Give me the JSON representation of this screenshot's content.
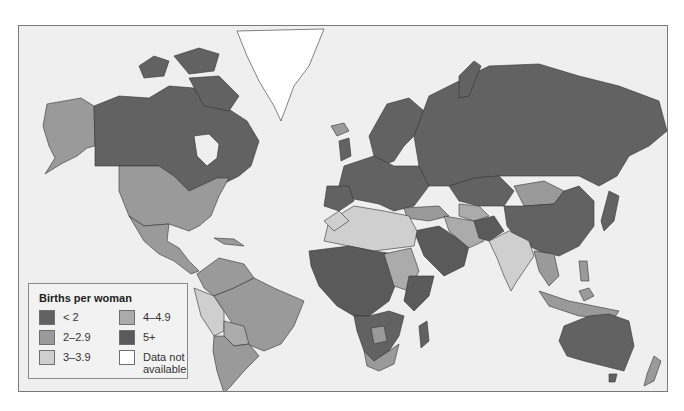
{
  "legend": {
    "title": "Births per woman",
    "items": [
      {
        "label": "< 2",
        "color": "#626262"
      },
      {
        "label": "2–2.9",
        "color": "#9a9a9a"
      },
      {
        "label": "3–3.9",
        "color": "#cfcfcf"
      },
      {
        "label": "4–4.9",
        "color": "#ababab"
      },
      {
        "label": "5+",
        "color": "#5a5a5a"
      },
      {
        "label": "Data not available",
        "color": "#ffffff"
      }
    ]
  },
  "colors": {
    "water": "#efefef",
    "border": "#333333",
    "frame": "#7a7a7a"
  }
}
